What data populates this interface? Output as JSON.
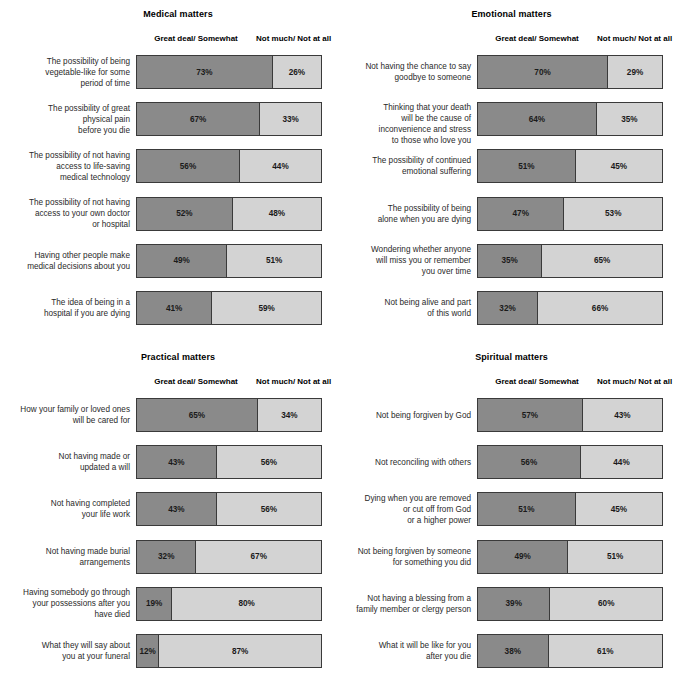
{
  "figure": {
    "type": "grouped-horizontal-stacked-bar",
    "panel_count": 4,
    "column_headers": [
      "Great deal/\nSomewhat",
      "Not much/\nNot at all"
    ],
    "colors": {
      "dark": "#8a8a8a",
      "light": "#d3d3d3",
      "border": "#3a3a3a",
      "background": "#ffffff"
    }
  },
  "chart_data": [
    {
      "type": "bar",
      "title": "Medical matters",
      "xlabel": "",
      "ylabel": "",
      "xlim": [
        0,
        100
      ],
      "grid": false,
      "legend_position": "top",
      "series": [
        {
          "name": "Great deal/Somewhat",
          "color": "#8a8a8a"
        },
        {
          "name": "Not much/Not at all",
          "color": "#d3d3d3"
        }
      ],
      "categories": [
        "The possibility of being\nvegetable-like for some\nperiod of time",
        "The possibility of great\nphysical pain\nbefore you die",
        "The possibility of not having\naccess to life-saving\nmedical technology",
        "The possibility of not having\naccess to your own doctor\nor hospital",
        "Having other people make\nmedical decisions about you",
        "The idea of being in a\nhospital if you are dying"
      ],
      "values_dark": [
        73,
        67,
        56,
        52,
        49,
        41
      ],
      "values_light": [
        26,
        33,
        44,
        48,
        51,
        59
      ],
      "labels_dark": [
        "73%",
        "67%",
        "56%",
        "52%",
        "49%",
        "41%"
      ],
      "labels_light": [
        "26%",
        "33%",
        "44%",
        "48%",
        "51%",
        "59%"
      ]
    },
    {
      "type": "bar",
      "title": "Emotional matters",
      "xlabel": "",
      "ylabel": "",
      "xlim": [
        0,
        100
      ],
      "grid": false,
      "legend_position": "top",
      "series": [
        {
          "name": "Great deal/Somewhat",
          "color": "#8a8a8a"
        },
        {
          "name": "Not much/Not at all",
          "color": "#d3d3d3"
        }
      ],
      "categories": [
        "Not having the chance to say\ngoodbye to someone",
        "Thinking that your death\nwill be the cause of\ninconvenience and stress\nto those who love you",
        "The possibility of continued\nemotional suffering",
        "The possibility of being\nalone when you are dying",
        "Wondering whether anyone\nwill miss you or remember\nyou over time",
        "Not being alive and part\nof this world"
      ],
      "values_dark": [
        70,
        64,
        51,
        47,
        35,
        32
      ],
      "values_light": [
        29,
        35,
        45,
        53,
        65,
        66
      ],
      "labels_dark": [
        "70%",
        "64%",
        "51%",
        "47%",
        "35%",
        "32%"
      ],
      "labels_light": [
        "29%",
        "35%",
        "45%",
        "53%",
        "65%",
        "66%"
      ]
    },
    {
      "type": "bar",
      "title": "Practical matters",
      "xlabel": "",
      "ylabel": "",
      "xlim": [
        0,
        100
      ],
      "grid": false,
      "legend_position": "top",
      "series": [
        {
          "name": "Great deal/Somewhat",
          "color": "#8a8a8a"
        },
        {
          "name": "Not much/Not at all",
          "color": "#d3d3d3"
        }
      ],
      "categories": [
        "How your family or loved ones\nwill be cared for",
        "Not having made or\nupdated a will",
        "Not having completed\nyour life work",
        "Not having made burial\narrangements",
        "Having somebody go through\nyour possessions after you\nhave died",
        "What they will say about\nyou at your funeral"
      ],
      "values_dark": [
        65,
        43,
        43,
        32,
        19,
        12
      ],
      "values_light": [
        34,
        56,
        56,
        67,
        80,
        87
      ],
      "labels_dark": [
        "65%",
        "43%",
        "43%",
        "32%",
        "19%",
        "12%"
      ],
      "labels_light": [
        "34%",
        "56%",
        "56%",
        "67%",
        "80%",
        "87%"
      ]
    },
    {
      "type": "bar",
      "title": "Spiritual matters",
      "xlabel": "",
      "ylabel": "",
      "xlim": [
        0,
        100
      ],
      "grid": false,
      "legend_position": "top",
      "series": [
        {
          "name": "Great deal/Somewhat",
          "color": "#8a8a8a"
        },
        {
          "name": "Not much/Not at all",
          "color": "#d3d3d3"
        }
      ],
      "categories": [
        "Not being forgiven by God",
        "Not reconciling with others",
        "Dying when you are removed\nor cut off from God\nor a higher power",
        "Not being forgiven by someone\nfor something you did",
        "Not having a blessing from a\nfamily member or clergy person",
        "What it will be like for you\nafter you die"
      ],
      "values_dark": [
        57,
        56,
        51,
        49,
        39,
        38
      ],
      "values_light": [
        43,
        44,
        45,
        51,
        60,
        61
      ],
      "labels_dark": [
        "57%",
        "56%",
        "51%",
        "49%",
        "39%",
        "38%"
      ],
      "labels_light": [
        "43%",
        "44%",
        "45%",
        "51%",
        "60%",
        "61%"
      ]
    }
  ]
}
